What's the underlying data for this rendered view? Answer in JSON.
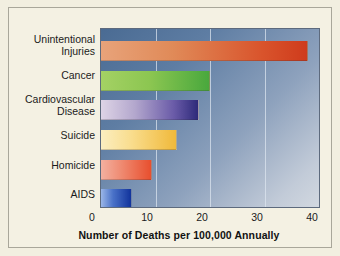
{
  "chart_data": {
    "type": "bar",
    "orientation": "horizontal",
    "title": "",
    "xlabel": "Number of Deaths per 100,000 Annually",
    "ylabel": "",
    "categories": [
      "Unintentional\nInjuries",
      "Cancer",
      "Cardiovascular\nDisease",
      "Suicide",
      "Homicide",
      "AIDS"
    ],
    "values": [
      38,
      20,
      18,
      14,
      9.3,
      5.6
    ],
    "xlim": [
      0,
      40
    ],
    "xticks": [
      "0",
      "10",
      "20",
      "30",
      "40"
    ],
    "xtick_values": [
      0,
      10,
      20,
      30,
      40
    ],
    "grid": "vertical",
    "legend": "none",
    "bar_colors": [
      "#d9542c",
      "#8cc651",
      "#2e2a7a",
      "#f0b93a",
      "#e84f2e",
      "#11339c"
    ],
    "plot_background": "#5e7da3",
    "figure_background": "#f4f1e3"
  }
}
